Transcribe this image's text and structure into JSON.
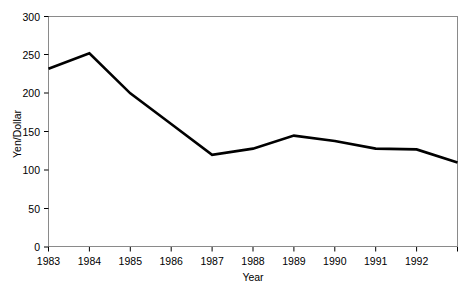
{
  "chart_data": {
    "type": "line",
    "title": "",
    "xlabel": "Year",
    "ylabel": "Yen/Dollar",
    "x": [
      1983,
      1984,
      1985,
      1986,
      1987,
      1988,
      1989,
      1990,
      1991,
      1992,
      1993
    ],
    "values": [
      232,
      252,
      200,
      160,
      120,
      128,
      145,
      138,
      128,
      127,
      110
    ],
    "series": [
      {
        "name": "Yen/Dollar",
        "values": [
          232,
          252,
          200,
          160,
          120,
          128,
          145,
          138,
          128,
          127,
          110
        ]
      }
    ],
    "xlim": [
      1983,
      1993
    ],
    "ylim": [
      0,
      300
    ],
    "ytick_labels": [
      "0",
      "50",
      "100",
      "150",
      "200",
      "250",
      "300"
    ],
    "ytick_values": [
      0,
      50,
      100,
      150,
      200,
      250,
      300
    ],
    "xtick_labels": [
      "1983",
      "1984",
      "1985",
      "1986",
      "1987",
      "1988",
      "1989",
      "1990",
      "1991",
      "1992"
    ],
    "xtick_values": [
      1983,
      1984,
      1985,
      1986,
      1987,
      1988,
      1989,
      1990,
      1991,
      1992
    ],
    "grid": false,
    "legend": "none",
    "line_color": "#000000",
    "frame_color": "#808080"
  }
}
